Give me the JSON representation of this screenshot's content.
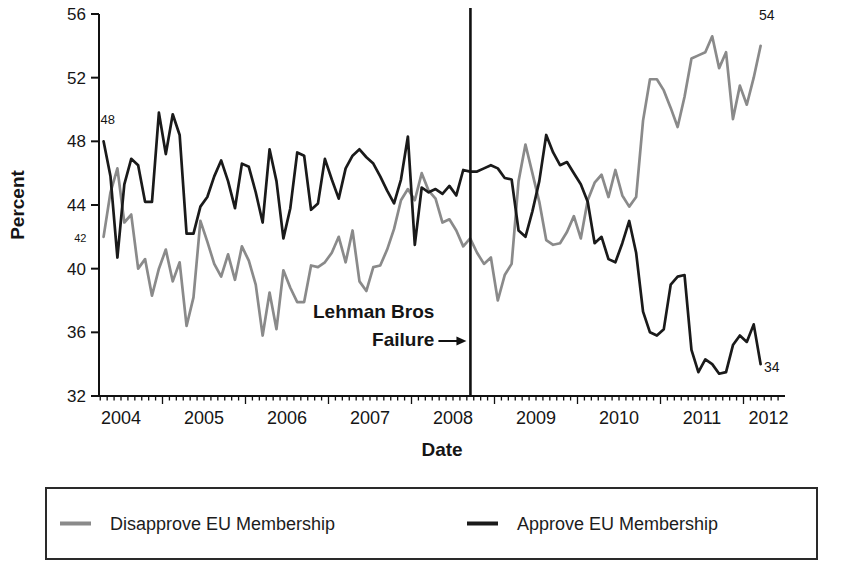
{
  "chart_data": {
    "type": "line",
    "title": "",
    "xlabel": "Date",
    "ylabel": "Percent",
    "ylim": [
      32,
      56
    ],
    "yticks": [
      32,
      36,
      40,
      44,
      48,
      52,
      56
    ],
    "grid": false,
    "legend_position": "bottom-box",
    "x_unit": "decimal_year_monthly",
    "x_start": 2004.29,
    "x_step": 0.08333,
    "x_year_labels": [
      {
        "label": "2004",
        "x": 2004.5
      },
      {
        "label": "2005",
        "x": 2005.5
      },
      {
        "label": "2006",
        "x": 2006.5
      },
      {
        "label": "2007",
        "x": 2007.5
      },
      {
        "label": "2008",
        "x": 2008.5
      },
      {
        "label": "2009",
        "x": 2009.5
      },
      {
        "label": "2010",
        "x": 2010.5
      },
      {
        "label": "2011",
        "x": 2011.5
      },
      {
        "label": "2012",
        "x": 2012.3
      }
    ],
    "series": [
      {
        "name": "Disapprove EU Membership",
        "color": "#8a8a8a",
        "values": [
          42.0,
          44.8,
          46.3,
          42.9,
          43.4,
          40.0,
          40.6,
          38.3,
          40.0,
          41.2,
          39.2,
          40.4,
          36.4,
          38.2,
          43.0,
          41.7,
          40.3,
          39.5,
          40.9,
          39.3,
          41.4,
          40.5,
          39.0,
          35.8,
          38.5,
          36.2,
          39.9,
          38.8,
          37.9,
          37.9,
          40.2,
          40.1,
          40.4,
          41.0,
          42.0,
          40.4,
          42.4,
          39.2,
          38.6,
          40.1,
          40.2,
          41.2,
          42.5,
          44.3,
          45.0,
          44.3,
          46.0,
          44.9,
          44.4,
          42.9,
          43.1,
          42.4,
          41.4,
          41.9,
          41.0,
          40.3,
          40.7,
          38.0,
          39.6,
          40.3,
          45.5,
          47.8,
          46.0,
          44.2,
          41.8,
          41.5,
          41.6,
          42.3,
          43.3,
          41.9,
          44.3,
          45.4,
          45.9,
          44.5,
          46.2,
          44.6,
          43.9,
          44.5,
          49.3,
          51.9,
          51.9,
          51.2,
          50.1,
          48.9,
          50.8,
          53.2,
          53.4,
          53.6,
          54.6,
          52.6,
          53.6,
          49.4,
          51.5,
          50.3,
          52.0,
          54.0
        ]
      },
      {
        "name": "Approve EU Membership",
        "color": "#1a1a1a",
        "values": [
          48.0,
          45.8,
          40.7,
          45.3,
          46.9,
          46.5,
          44.2,
          44.2,
          49.8,
          47.2,
          49.7,
          48.4,
          42.2,
          42.2,
          43.9,
          44.5,
          45.8,
          46.8,
          45.5,
          43.8,
          46.6,
          46.4,
          44.8,
          42.9,
          47.5,
          45.5,
          41.9,
          43.8,
          47.3,
          47.1,
          43.7,
          44.1,
          46.9,
          45.6,
          44.4,
          46.3,
          47.1,
          47.5,
          47.0,
          46.6,
          45.8,
          44.9,
          44.1,
          45.6,
          48.3,
          41.5,
          45.1,
          44.8,
          45.0,
          44.7,
          45.2,
          44.6,
          46.2,
          46.1,
          46.1,
          46.3,
          46.5,
          46.3,
          45.7,
          45.6,
          42.4,
          42.0,
          43.6,
          45.5,
          48.4,
          47.3,
          46.5,
          46.7,
          46.0,
          45.3,
          44.2,
          41.6,
          42.0,
          40.6,
          40.4,
          41.6,
          43.0,
          41.0,
          37.3,
          36.0,
          35.8,
          36.2,
          39.0,
          39.5,
          39.6,
          34.9,
          33.5,
          34.3,
          34.0,
          33.4,
          33.5,
          35.2,
          35.8,
          35.4,
          36.5,
          34.0
        ]
      }
    ],
    "annotations": {
      "vline": {
        "x": 2008.71,
        "label_line1": "Lehman Bros",
        "label_line2": "Failure"
      },
      "point_labels": [
        {
          "text": "48",
          "x": 2004.34,
          "y": 49.1,
          "size": 13
        },
        {
          "text": "42",
          "x": 2004.01,
          "y": 41.7,
          "size": 11
        },
        {
          "text": "54",
          "x": 2012.28,
          "y": 55.6,
          "size": 14
        },
        {
          "text": "34",
          "x": 2012.34,
          "y": 33.5,
          "size": 14
        }
      ]
    }
  }
}
